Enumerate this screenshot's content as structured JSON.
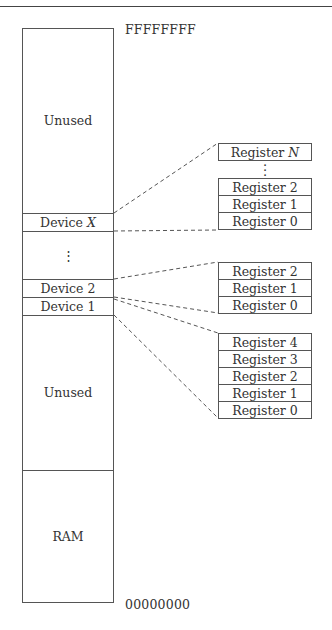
{
  "addresses": {
    "top": "FFFFFFFF",
    "bottom": "00000000"
  },
  "memory_map": [
    {
      "label": "Unused",
      "id": "unused-top"
    },
    {
      "label": "Device",
      "var": "X",
      "id": "device-x"
    },
    {
      "label": "⋮",
      "id": "ellipsis"
    },
    {
      "label": "Device 2",
      "id": "device-2"
    },
    {
      "label": "Device 1",
      "id": "device-1"
    },
    {
      "label": "Unused",
      "id": "unused-mid"
    },
    {
      "label": "RAM",
      "id": "ram"
    }
  ],
  "register_groups": [
    {
      "device": "Device X",
      "registers": [
        "Register",
        "Register 2",
        "Register 1",
        "Register 0"
      ],
      "top_var": "N",
      "ellipsis": "⋮"
    },
    {
      "device": "Device 2",
      "registers": [
        "Register 2",
        "Register 1",
        "Register 0"
      ]
    },
    {
      "device": "Device 1",
      "registers": [
        "Register 4",
        "Register 3",
        "Register 2",
        "Register 1",
        "Register 0"
      ]
    }
  ]
}
